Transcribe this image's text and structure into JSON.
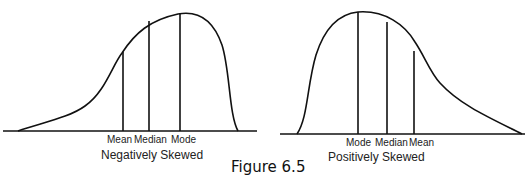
{
  "figure_caption": "Figure 6.5",
  "left_panel": {
    "title": "Negatively Skewed",
    "markers": [
      "Mean",
      "Median",
      "Mode"
    ]
  },
  "right_panel": {
    "title": "Positively Skewed",
    "markers": [
      "Mode",
      "Median",
      "Mean"
    ]
  },
  "colors": {
    "stroke": "#111111",
    "background": "#ffffff"
  }
}
